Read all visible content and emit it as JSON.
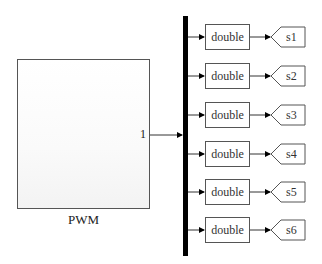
{
  "source_block": {
    "label": "PWM",
    "output_port": "1"
  },
  "bus": {
    "type": "demux",
    "color": "#000000"
  },
  "conversions": [
    {
      "label": "double"
    },
    {
      "label": "double"
    },
    {
      "label": "double"
    },
    {
      "label": "double"
    },
    {
      "label": "double"
    },
    {
      "label": "double"
    }
  ],
  "goto_tags": [
    {
      "label": "s1"
    },
    {
      "label": "s2"
    },
    {
      "label": "s3"
    },
    {
      "label": "s4"
    },
    {
      "label": "s5"
    },
    {
      "label": "s6"
    }
  ]
}
